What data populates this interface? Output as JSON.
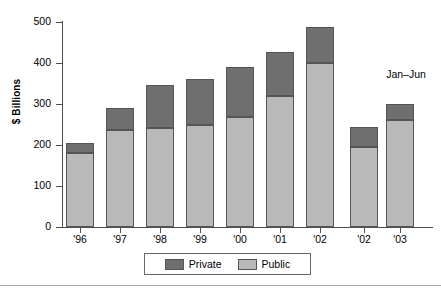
{
  "chart_data": {
    "type": "bar",
    "title": "",
    "subtitle": "",
    "xlabel": "",
    "ylabel": "$ Billions",
    "ylim": [
      0,
      500
    ],
    "yticks": [
      0,
      100,
      200,
      300,
      400,
      500
    ],
    "ytick_labels": [
      "0",
      "100",
      "200",
      "300",
      "400",
      "500"
    ],
    "grid": false,
    "stacked": true,
    "legend_position": "bottom-center",
    "legend": [
      "Private",
      "Public"
    ],
    "annotations": [
      {
        "text": "Jan–Jun",
        "target_group": "partial-year"
      }
    ],
    "groups": [
      {
        "name": "full-year",
        "categories": [
          "'96",
          "'97",
          "'98",
          "'99",
          "'00",
          "'01",
          "'02"
        ],
        "series": [
          {
            "name": "Public",
            "values": [
              180,
              237,
              242,
              249,
              268,
              320,
              400
            ]
          },
          {
            "name": "Private",
            "values": [
              25,
              53,
              105,
              112,
              123,
              107,
              89
            ]
          }
        ],
        "totals": [
          205,
          290,
          347,
          361,
          391,
          489
        ]
      },
      {
        "name": "partial-year",
        "label": "Jan–Jun",
        "categories": [
          "'02",
          "'03"
        ],
        "series": [
          {
            "name": "Public",
            "values": [
              195,
              260
            ]
          },
          {
            "name": "Private",
            "values": [
              48,
              40
            ]
          }
        ],
        "totals": [
          243,
          300
        ]
      }
    ],
    "colors": {
      "private": "#6f6f6f",
      "public": "#b9b9b9",
      "axis": "#4e4e4e",
      "bar_border": "#555555",
      "background": "#ffffff"
    }
  },
  "axis": {
    "y_title": "$ Billions",
    "y_labels": [
      "500",
      "400",
      "300",
      "200",
      "100",
      "0"
    ],
    "x_labels_main": [
      "'96",
      "'97",
      "'98",
      "'99",
      "'00",
      "'01",
      "'02"
    ],
    "x_labels_partial": [
      "'02",
      "'03"
    ]
  },
  "legend": {
    "private_label": "Private",
    "public_label": "Public"
  },
  "annotation": {
    "jan_jun": "Jan–Jun"
  }
}
